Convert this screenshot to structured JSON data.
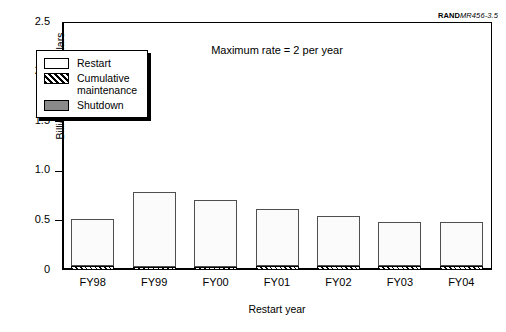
{
  "source_tag": {
    "brand": "RAND",
    "code": "MR456-3.5"
  },
  "chart_data": {
    "type": "bar",
    "stacked": true,
    "title": "",
    "annotation": "Maximum rate = 2 per year",
    "xlabel": "Restart year",
    "ylabel": "Billions of FY92 dollars",
    "categories": [
      "FY98",
      "FY99",
      "FY00",
      "FY01",
      "FY02",
      "FY03",
      "FY04"
    ],
    "ylim": [
      0,
      2.5
    ],
    "yticks": [
      0,
      0.5,
      1.0,
      1.5,
      2.0,
      2.5
    ],
    "ytick_labels": [
      "0",
      "0.5",
      "1.0",
      "1.5",
      "2.0",
      "2.5"
    ],
    "grid": false,
    "legend_position": "upper-left-inside",
    "series": [
      {
        "name": "Shutdown",
        "style": "solid-gray",
        "color": "#8a8a8a",
        "values": [
          0.0,
          0.0,
          0.0,
          0.0,
          0.0,
          0.0,
          0.0
        ]
      },
      {
        "name": "Cumulative maintenance",
        "style": "hatched",
        "color": "#000000",
        "values": [
          0.04,
          0.035,
          0.035,
          0.04,
          0.04,
          0.04,
          0.04
        ]
      },
      {
        "name": "Restart",
        "style": "open-white",
        "color": "#ffffff",
        "values": [
          0.47,
          0.755,
          0.675,
          0.58,
          0.505,
          0.44,
          0.44
        ]
      }
    ],
    "totals": [
      0.51,
      0.79,
      0.71,
      0.62,
      0.545,
      0.48,
      0.48
    ]
  },
  "legend": {
    "items": [
      {
        "label": "Restart",
        "swatch": "open-white"
      },
      {
        "label": "Cumulative\nmaintenance",
        "swatch": "hatched"
      },
      {
        "label": "Shutdown",
        "swatch": "solid-gray"
      }
    ]
  }
}
